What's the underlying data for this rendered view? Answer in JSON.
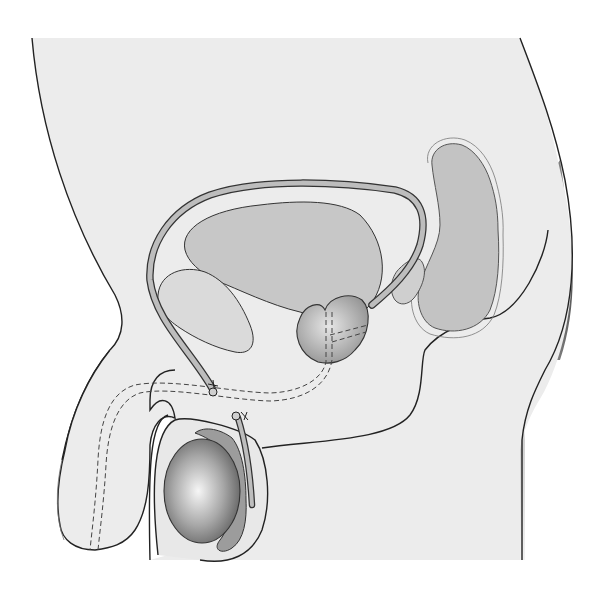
{
  "figure": {
    "labels": [],
    "colors": {
      "background": "#ffffff",
      "body_fill": "#ededed",
      "organ_fill": "#c6c6c6",
      "outline": "#222222",
      "shadow": "#8a8a8a",
      "vas_fill": "#b5b5b5",
      "testis_center": "#f4f4f4",
      "testis_edge": "#6e6e6e"
    },
    "structures": [
      {
        "id": "body-outline",
        "name": "Body profile"
      },
      {
        "id": "bladder",
        "name": "Urinary bladder"
      },
      {
        "id": "pubic-bone",
        "name": "Pubic symphysis"
      },
      {
        "id": "vas-deferens",
        "name": "Vas deferens (ligated)"
      },
      {
        "id": "prostate",
        "name": "Prostate gland"
      },
      {
        "id": "seminal-vesicle",
        "name": "Seminal vesicle"
      },
      {
        "id": "rectum",
        "name": "Rectum"
      },
      {
        "id": "urethra",
        "name": "Urethra (dashed)"
      },
      {
        "id": "penis",
        "name": "Penis"
      },
      {
        "id": "testis",
        "name": "Testis"
      },
      {
        "id": "epididymis",
        "name": "Epididymis"
      },
      {
        "id": "scrotum",
        "name": "Scrotum"
      }
    ]
  }
}
